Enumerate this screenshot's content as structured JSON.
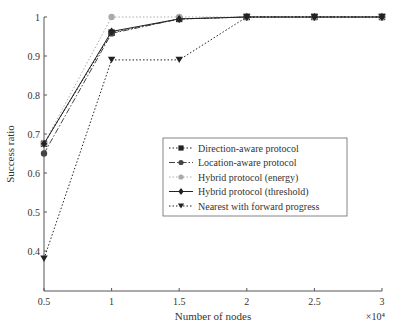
{
  "chart_data": {
    "type": "line",
    "title": "",
    "xlabel": "Number of nodes",
    "x_multiplier": "×10⁴",
    "ylabel": "Success ratio",
    "x": [
      0.5,
      1,
      1.5,
      2,
      2.5,
      3
    ],
    "xticks": [
      "0.5",
      "1",
      "1.5",
      "2",
      "2.5",
      "3"
    ],
    "yticks": [
      "0.4",
      "0.5",
      "0.6",
      "0.7",
      "0.8",
      "0.9",
      "1"
    ],
    "xlim": [
      0.5,
      3
    ],
    "ylim": [
      0.3,
      1
    ],
    "grid": false,
    "legend_position": "center-right",
    "series": [
      {
        "name": "Direction-aware protocol",
        "values": [
          0.675,
          0.96,
          0.995,
          1.0,
          1.0,
          1.0
        ],
        "marker": "square",
        "dash": "dotted",
        "color": "#222222"
      },
      {
        "name": "Location-aware protocol",
        "values": [
          0.65,
          0.958,
          0.995,
          1.0,
          1.0,
          1.0
        ],
        "marker": "circle",
        "dash": "dashdot",
        "color": "#444444"
      },
      {
        "name": "Hybrid protocol (energy)",
        "values": [
          0.675,
          1.0,
          1.0,
          1.0,
          1.0,
          1.0
        ],
        "marker": "circle",
        "dash": "dotted",
        "color": "#aaaaaa"
      },
      {
        "name": "Hybrid protocol (threshold)",
        "values": [
          0.675,
          0.963,
          0.995,
          1.0,
          1.0,
          1.0
        ],
        "marker": "diamond",
        "dash": "solid",
        "color": "#222222"
      },
      {
        "name": "Nearest with forward progress",
        "values": [
          0.38,
          0.89,
          0.89,
          1.0,
          1.0,
          1.0
        ],
        "marker": "triangle-down",
        "dash": "dotted",
        "color": "#222222"
      }
    ]
  }
}
